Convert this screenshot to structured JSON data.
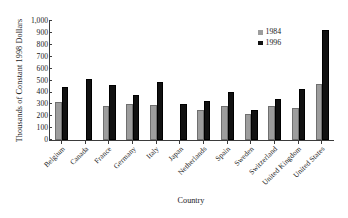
{
  "chart_data": {
    "type": "bar",
    "title": "",
    "xlabel": "Country",
    "ylabel": "Thousands of Constant 1998 Dollars",
    "ylim": [
      0,
      1000
    ],
    "ytick_labels": [
      "1,000",
      "900",
      "800",
      "700",
      "600",
      "500",
      "400",
      "300",
      "200",
      "100",
      "0"
    ],
    "ytick_values": [
      1000,
      900,
      800,
      700,
      600,
      500,
      400,
      300,
      200,
      100,
      0
    ],
    "grid": false,
    "legend_position": "top-right",
    "categories": [
      "Belgium",
      "Canada",
      "France",
      "Germany",
      "Italy",
      "Japan",
      "Netherlands",
      "Spain",
      "Sweden",
      "Switzerland",
      "United Kingdom",
      "United States"
    ],
    "series": [
      {
        "name": "1984",
        "color": "#9d9d9d",
        "values": [
          320,
          null,
          290,
          305,
          295,
          null,
          255,
          290,
          215,
          285,
          265,
          470
        ]
      },
      {
        "name": "1996",
        "color": "#111111",
        "values": [
          445,
          510,
          465,
          375,
          490,
          300,
          325,
          400,
          250,
          345,
          430,
          925
        ]
      }
    ]
  },
  "legend": {
    "entries": [
      {
        "label": "1984"
      },
      {
        "label": "1996"
      }
    ]
  }
}
